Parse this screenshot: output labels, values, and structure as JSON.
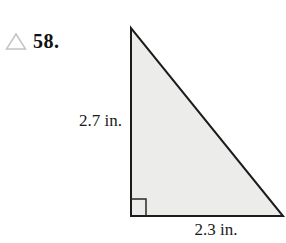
{
  "problem": {
    "marker_icon": "triangle-outline",
    "number": "58."
  },
  "figure": {
    "type": "right-triangle",
    "left_side_label": "2.7 in.",
    "bottom_side_label": "2.3 in.",
    "fill_color": "#ececeb",
    "stroke_color": "#1c1c1c",
    "marker_color": "#c4c4c4"
  }
}
